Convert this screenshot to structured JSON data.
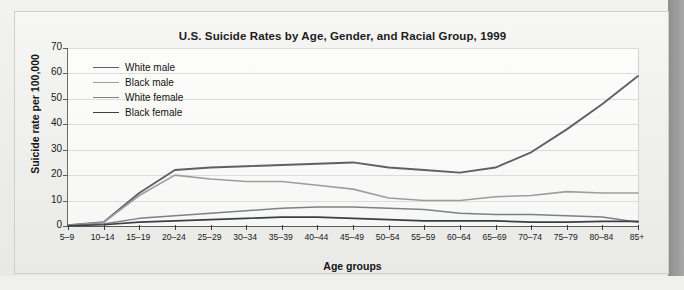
{
  "figure": {
    "title": "U.S. Suicide Rates by Age, Gender, and Racial Group, 1999",
    "y_axis_title": "Suicide rate per 100,000",
    "x_axis_title": "Age groups"
  },
  "colors": {
    "white_male": "#5d6166",
    "black_male": "#9b9ea1",
    "white_female": "#7d8185",
    "black_female": "#3c4046",
    "grid": "#dcdcd9",
    "axis": "#5a5a5a",
    "panel": "#fbfbfa",
    "frame": "#cfcfcc",
    "page": "#efefed",
    "page_edge_shadow": "#8e8e8e"
  },
  "legend": {
    "position": "top-left-inside",
    "entries": [
      {
        "label": "White male",
        "color": "#5d6166",
        "width": 1.9
      },
      {
        "label": "Black male",
        "color": "#9b9ea1",
        "width": 1.6
      },
      {
        "label": "White female",
        "color": "#7d8185",
        "width": 1.6
      },
      {
        "label": "Black female",
        "color": "#3c4046",
        "width": 1.9
      }
    ]
  },
  "chart_data": {
    "type": "line",
    "title": "U.S. Suicide Rates by Age, Gender, and Racial Group, 1999",
    "xlabel": "Age groups",
    "ylabel": "Suicide rate per 100,000",
    "ylim": [
      0,
      70
    ],
    "yticks": [
      0,
      10,
      20,
      30,
      40,
      50,
      60,
      70
    ],
    "grid": true,
    "categories": [
      "5–9",
      "10–14",
      "15–19",
      "20–24",
      "25–29",
      "30–34",
      "35–39",
      "40–44",
      "45–49",
      "50–54",
      "55–59",
      "60–64",
      "65–69",
      "70–74",
      "75–79",
      "80–84",
      "85+"
    ],
    "series": [
      {
        "name": "White male",
        "color": "#5d6166",
        "values": [
          0.3,
          1.5,
          13.0,
          22.0,
          23.0,
          23.5,
          24.0,
          24.5,
          25.0,
          23.0,
          22.0,
          21.0,
          23.0,
          29.0,
          38.0,
          48.0,
          59.0
        ]
      },
      {
        "name": "Black male",
        "color": "#9b9ea1",
        "values": [
          0.3,
          1.4,
          12.0,
          20.0,
          18.5,
          17.5,
          17.5,
          16.0,
          14.5,
          11.0,
          10.0,
          10.0,
          11.5,
          12.0,
          13.5,
          13.0,
          13.0
        ]
      },
      {
        "name": "White female",
        "color": "#7d8185",
        "values": [
          0.2,
          0.8,
          3.0,
          4.0,
          5.0,
          6.0,
          7.0,
          7.5,
          7.5,
          7.0,
          6.5,
          5.0,
          4.5,
          4.5,
          4.0,
          3.5,
          1.5
        ]
      },
      {
        "name": "Black female",
        "color": "#3c4046",
        "values": [
          0.1,
          0.5,
          1.5,
          2.0,
          2.5,
          3.0,
          3.5,
          3.5,
          3.0,
          2.5,
          2.0,
          2.0,
          2.0,
          1.5,
          1.5,
          1.8,
          1.8
        ]
      }
    ]
  }
}
